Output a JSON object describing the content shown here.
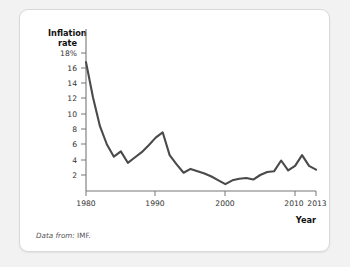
{
  "card": {
    "source_note_label": "Data from:",
    "source_note_value": "IMF."
  },
  "chart_data": {
    "type": "line",
    "title": "",
    "ylabel_line1": "Inflation",
    "ylabel_line2": "rate",
    "xlabel": "Year",
    "xlim": [
      1980,
      2013
    ],
    "ylim": [
      0,
      19
    ],
    "grid": false,
    "legend": "none",
    "line_color": "#4a4a4a",
    "axis_color": "#777777",
    "y_ticks": [
      2,
      4,
      6,
      8,
      10,
      12,
      14,
      16,
      18
    ],
    "y_tick_labels": [
      "2",
      "4",
      "6",
      "8",
      "10",
      "12",
      "14",
      "16",
      "18%"
    ],
    "x_ticks": [
      1980,
      1990,
      2000,
      2010,
      2013
    ],
    "x_tick_labels": [
      "1980",
      "1990",
      "2000",
      "2010",
      "2013"
    ],
    "x": [
      1980,
      1981,
      1982,
      1983,
      1984,
      1985,
      1986,
      1987,
      1988,
      1989,
      1990,
      1991,
      1992,
      1993,
      1994,
      1995,
      1996,
      1997,
      1998,
      1999,
      2000,
      2001,
      2002,
      2003,
      2004,
      2005,
      2006,
      2007,
      2008,
      2009,
      2010,
      2011,
      2012,
      2013
    ],
    "values": [
      16.8,
      12.2,
      8.4,
      6.0,
      4.4,
      5.1,
      3.6,
      4.3,
      5.0,
      5.9,
      6.9,
      7.6,
      4.6,
      3.4,
      2.3,
      2.8,
      2.5,
      2.2,
      1.8,
      1.3,
      0.8,
      1.3,
      1.5,
      1.6,
      1.4,
      2.0,
      2.4,
      2.5,
      3.9,
      2.6,
      3.2,
      4.6,
      3.2,
      2.7
    ],
    "series_name": "Inflation rate",
    "units": "percent"
  }
}
